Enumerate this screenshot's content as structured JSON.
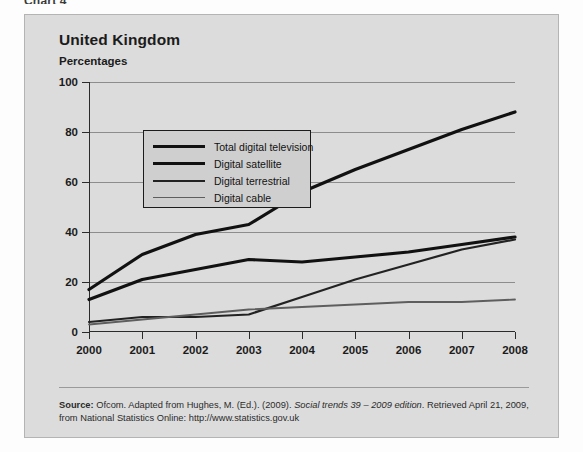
{
  "top_caption": "Chart 4",
  "chart_panel": {
    "title": "United Kingdom",
    "subtitle": "Percentages"
  },
  "legend": {
    "items": [
      {
        "label": "Total digital television",
        "color": "#111111",
        "width": 3.2
      },
      {
        "label": "Digital satellite",
        "color": "#111111",
        "width": 3.2
      },
      {
        "label": "Digital terrestrial",
        "color": "#222222",
        "width": 2.2
      },
      {
        "label": "Digital cable",
        "color": "#5e5e5e",
        "width": 1.8
      }
    ]
  },
  "source": {
    "label": "Source:",
    "line1": "Ofcom. Adapted from Hughes, M. (Ed.). (2009). ",
    "italic": "Social trends 39 – 2009 edition",
    "line1b": ". Retrieved April 21, 2009, from National",
    "line2": "Statistics Online: http://www.statistics.gov.uk"
  },
  "chart_data": {
    "type": "line",
    "title": "United Kingdom",
    "subtitle": "Percentages",
    "xlabel": "",
    "ylabel": "Percentages",
    "categories": [
      "2000",
      "2001",
      "2002",
      "2003",
      "2004",
      "2005",
      "2006",
      "2007",
      "2008"
    ],
    "x": [
      2000,
      2001,
      2002,
      2003,
      2004,
      2005,
      2006,
      2007,
      2008
    ],
    "ylim": [
      0,
      100
    ],
    "yticks": [
      0,
      20,
      40,
      60,
      80,
      100
    ],
    "grid": true,
    "legend_position": "inside-upper-left",
    "series": [
      {
        "name": "Total digital television",
        "values": [
          17,
          31,
          39,
          43,
          56,
          65,
          73,
          81,
          88
        ],
        "color": "#111111",
        "width": 3.2
      },
      {
        "name": "Digital satellite",
        "values": [
          13,
          21,
          25,
          29,
          28,
          30,
          32,
          35,
          38
        ],
        "color": "#111111",
        "width": 3.2
      },
      {
        "name": "Digital terrestrial",
        "values": [
          4,
          6,
          6,
          7,
          14,
          21,
          27,
          33,
          37
        ],
        "color": "#222222",
        "width": 2.2
      },
      {
        "name": "Digital cable",
        "values": [
          3,
          5,
          7,
          9,
          10,
          11,
          12,
          12,
          13
        ],
        "color": "#5e5e5e",
        "width": 1.8
      }
    ]
  }
}
